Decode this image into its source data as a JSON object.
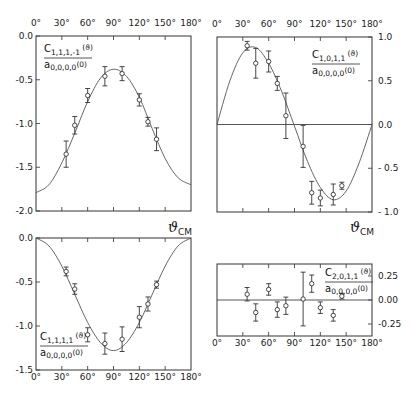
{
  "figure": {
    "axis_title_symbol": "ϑ",
    "axis_title_sub": "CM"
  },
  "chart_data": [
    {
      "id": "c1111m1",
      "type": "scatter",
      "title": "",
      "label_num": "C",
      "label_num_sub": "1,1,1,-1",
      "label_num_arg": "(ϑ)",
      "label_den": "a",
      "label_den_sub": "0,0,0,0",
      "label_den_arg": "(0)",
      "xlabel": "ϑCM",
      "ylabel": "",
      "xlim": [
        0,
        180
      ],
      "ylim": [
        -2.0,
        0.0
      ],
      "xticks": [
        0,
        30,
        60,
        90,
        120,
        150,
        180
      ],
      "xtick_labels": [
        "0°",
        "30°",
        "60°",
        "90°",
        "120°",
        "150°",
        "180°"
      ],
      "xtick_side": "top",
      "yticks": [
        0.0,
        -0.5,
        -1.0,
        -1.5,
        -2.0
      ],
      "ytick_labels": [
        "0.0",
        "-0.5",
        "-1.0",
        "-1.5",
        "-2.0"
      ],
      "ytick_side": "left",
      "zero_line": false,
      "points": [
        {
          "x": 35,
          "y": -1.35,
          "err": 0.15
        },
        {
          "x": 45,
          "y": -1.02,
          "err": 0.1
        },
        {
          "x": 60,
          "y": -0.68,
          "err": 0.08
        },
        {
          "x": 80,
          "y": -0.46,
          "err": 0.11
        },
        {
          "x": 100,
          "y": -0.43,
          "err": 0.08
        },
        {
          "x": 120,
          "y": -0.73,
          "err": 0.07
        },
        {
          "x": 130,
          "y": -0.98,
          "err": 0.05
        },
        {
          "x": 140,
          "y": -1.18,
          "err": 0.13
        }
      ],
      "fit_curve": {
        "x": [
          0,
          15,
          30,
          45,
          60,
          75,
          90,
          105,
          120,
          135,
          150,
          165,
          180
        ],
        "y": [
          -1.79,
          -1.7,
          -1.45,
          -1.11,
          -0.75,
          -0.48,
          -0.38,
          -0.46,
          -0.7,
          -1.06,
          -1.4,
          -1.62,
          -1.7
        ]
      }
    },
    {
      "id": "c1011",
      "type": "scatter",
      "title": "",
      "label_num": "C",
      "label_num_sub": "1,0,1,1",
      "label_num_arg": "(ϑ)",
      "label_den": "a",
      "label_den_sub": "0,0,0,0",
      "label_den_arg": "(0)",
      "xlabel": "ϑCM",
      "ylabel": "",
      "xlim": [
        0,
        180
      ],
      "ylim": [
        -1.0,
        1.0
      ],
      "xticks": [
        0,
        30,
        60,
        90,
        120,
        150,
        180
      ],
      "xtick_labels": [
        "0°",
        "30°",
        "60°",
        "90°",
        "120°",
        "150°",
        "180°"
      ],
      "xtick_side": "top",
      "yticks": [
        1.0,
        0.5,
        0.0,
        -0.5,
        -1.0
      ],
      "ytick_labels": [
        "1.0",
        "0.5",
        "0.0",
        "- 0.5",
        "- 1.0"
      ],
      "ytick_side": "right",
      "zero_line": true,
      "points": [
        {
          "x": 35,
          "y": 0.9,
          "err": 0.05
        },
        {
          "x": 45,
          "y": 0.7,
          "err": 0.17
        },
        {
          "x": 60,
          "y": 0.72,
          "err": 0.12
        },
        {
          "x": 70,
          "y": 0.47,
          "err": 0.08
        },
        {
          "x": 80,
          "y": 0.1,
          "err": 0.26
        },
        {
          "x": 100,
          "y": -0.25,
          "err": 0.24
        },
        {
          "x": 110,
          "y": -0.78,
          "err": 0.13
        },
        {
          "x": 120,
          "y": -0.84,
          "err": 0.09
        },
        {
          "x": 135,
          "y": -0.8,
          "err": 0.12
        },
        {
          "x": 145,
          "y": -0.7,
          "err": 0.04
        }
      ],
      "fit_curve": {
        "x": [
          0,
          15,
          30,
          45,
          60,
          75,
          90,
          105,
          120,
          135,
          150,
          165,
          180
        ],
        "y": [
          0.0,
          0.5,
          0.82,
          0.88,
          0.7,
          0.38,
          -0.02,
          -0.42,
          -0.72,
          -0.86,
          -0.76,
          -0.44,
          0.0
        ]
      }
    },
    {
      "id": "c1111",
      "type": "scatter",
      "title": "",
      "label_num": "C",
      "label_num_sub": "1,1,1,1",
      "label_num_arg": "(ϑ)",
      "label_den": "a",
      "label_den_sub": "0,0,0,0",
      "label_den_arg": "(0)",
      "xlabel": "",
      "ylabel": "",
      "xlim": [
        0,
        180
      ],
      "ylim": [
        -1.5,
        0.0
      ],
      "xticks": [
        0,
        30,
        60,
        90,
        120,
        150,
        180
      ],
      "xtick_labels": [
        "0°",
        "30°",
        "60°",
        "90°",
        "120°",
        "150°",
        "180°"
      ],
      "xtick_side": "bottom",
      "yticks": [
        0.0,
        -0.5,
        -1.0,
        -1.5
      ],
      "ytick_labels": [
        "0.0",
        "-0.5",
        "-1.0",
        "-1.5"
      ],
      "ytick_side": "left",
      "zero_line": false,
      "points": [
        {
          "x": 35,
          "y": -0.38,
          "err": 0.05
        },
        {
          "x": 45,
          "y": -0.58,
          "err": 0.06
        },
        {
          "x": 60,
          "y": -1.1,
          "err": 0.08
        },
        {
          "x": 80,
          "y": -1.2,
          "err": 0.12
        },
        {
          "x": 100,
          "y": -1.15,
          "err": 0.14
        },
        {
          "x": 120,
          "y": -0.9,
          "err": 0.12
        },
        {
          "x": 130,
          "y": -0.75,
          "err": 0.08
        },
        {
          "x": 140,
          "y": -0.53,
          "err": 0.04
        }
      ],
      "fit_curve": {
        "x": [
          0,
          15,
          30,
          45,
          60,
          75,
          90,
          105,
          120,
          135,
          150,
          165,
          180
        ],
        "y": [
          0.0,
          -0.09,
          -0.32,
          -0.64,
          -0.96,
          -1.19,
          -1.28,
          -1.19,
          -0.96,
          -0.64,
          -0.32,
          -0.09,
          0.0
        ]
      }
    },
    {
      "id": "c2011",
      "type": "scatter",
      "title": "",
      "label_num": "C",
      "label_num_sub": "2,0,1,1",
      "label_num_arg": "(ϑ)",
      "label_den": "a",
      "label_den_sub": "0,0,0,0",
      "label_den_arg": "(0)",
      "xlabel": "",
      "ylabel": "",
      "xlim": [
        0,
        180
      ],
      "ylim": [
        -0.375,
        0.375
      ],
      "xticks": [
        0,
        30,
        60,
        90,
        120,
        150,
        180
      ],
      "xtick_labels": [
        "0°",
        "30°",
        "60°",
        "90°",
        "120°",
        "150°",
        "180°"
      ],
      "xtick_side": "bottom",
      "yticks": [
        0.25,
        0.0,
        -0.25
      ],
      "ytick_labels": [
        "0.25",
        "0.00",
        "-0.25"
      ],
      "ytick_side": "right",
      "zero_line": true,
      "points": [
        {
          "x": 35,
          "y": 0.06,
          "err": 0.07
        },
        {
          "x": 45,
          "y": -0.13,
          "err": 0.09
        },
        {
          "x": 60,
          "y": 0.11,
          "err": 0.06
        },
        {
          "x": 70,
          "y": -0.1,
          "err": 0.08
        },
        {
          "x": 80,
          "y": -0.06,
          "err": 0.09
        },
        {
          "x": 100,
          "y": 0.01,
          "err": 0.28
        },
        {
          "x": 110,
          "y": 0.17,
          "err": 0.09
        },
        {
          "x": 120,
          "y": -0.08,
          "err": 0.06
        },
        {
          "x": 135,
          "y": -0.16,
          "err": 0.06
        },
        {
          "x": 145,
          "y": 0.04,
          "err": 0.03
        }
      ],
      "fit_curve": null
    }
  ]
}
